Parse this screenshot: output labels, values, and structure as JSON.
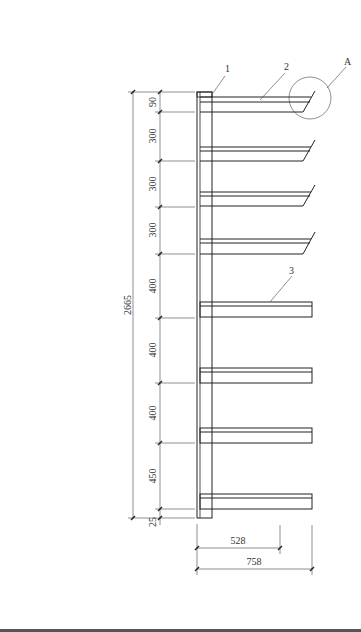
{
  "drawing": {
    "title": "Cantilever rack elevation",
    "callouts": [
      {
        "label": "1",
        "x": 213,
        "y": 70
      },
      {
        "label": "2",
        "x": 287,
        "y": 70
      },
      {
        "label": "3",
        "x": 291,
        "y": 273
      },
      {
        "label": "A",
        "x": 348,
        "y": 64
      }
    ],
    "total_height": "2665",
    "spacings": [
      "90",
      "300",
      "300",
      "300",
      "400",
      "400",
      "400",
      "450",
      "25"
    ],
    "arm_lengths": {
      "short": "528",
      "long": "758"
    },
    "colors": {
      "line": "#222222",
      "background": "#ffffff"
    }
  }
}
